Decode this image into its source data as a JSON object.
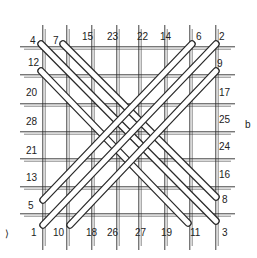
{
  "figure": {
    "panel_label": "b",
    "stray_mark": "⟩",
    "colors": {
      "ink": "#2a2a2a",
      "rod_fill": "#ffffff",
      "background": "#ffffff"
    }
  },
  "grid": {
    "columns_x": [
      44,
      68,
      93,
      118,
      140,
      166,
      191,
      217
    ],
    "rows_y": [
      48,
      76,
      105,
      133,
      160,
      188,
      215
    ],
    "left": 20,
    "right": 235,
    "top": 25,
    "bottom": 250
  },
  "labels": {
    "top": [
      {
        "text": "4",
        "x": 30,
        "y": 44
      },
      {
        "text": "7",
        "x": 53,
        "y": 44
      },
      {
        "text": "15",
        "x": 82,
        "y": 40
      },
      {
        "text": "23",
        "x": 107,
        "y": 40
      },
      {
        "text": "22",
        "x": 137,
        "y": 40
      },
      {
        "text": "14",
        "x": 160,
        "y": 40
      },
      {
        "text": "6",
        "x": 196,
        "y": 40
      },
      {
        "text": "2",
        "x": 219,
        "y": 40
      }
    ],
    "left": [
      {
        "text": "12",
        "x": 28,
        "y": 66
      },
      {
        "text": "20",
        "x": 26,
        "y": 96
      },
      {
        "text": "28",
        "x": 26,
        "y": 125
      },
      {
        "text": "21",
        "x": 26,
        "y": 154
      },
      {
        "text": "13",
        "x": 26,
        "y": 181
      },
      {
        "text": "5",
        "x": 28,
        "y": 209
      }
    ],
    "right": [
      {
        "text": "9",
        "x": 217,
        "y": 67
      },
      {
        "text": "17",
        "x": 219,
        "y": 96
      },
      {
        "text": "25",
        "x": 219,
        "y": 123
      },
      {
        "text": "24",
        "x": 219,
        "y": 150
      },
      {
        "text": "16",
        "x": 219,
        "y": 178
      },
      {
        "text": "8",
        "x": 222,
        "y": 203
      }
    ],
    "bottom": [
      {
        "text": "1",
        "x": 31,
        "y": 236
      },
      {
        "text": "10",
        "x": 53,
        "y": 236
      },
      {
        "text": "18",
        "x": 86,
        "y": 236
      },
      {
        "text": "26",
        "x": 107,
        "y": 236
      },
      {
        "text": "27",
        "x": 135,
        "y": 236
      },
      {
        "text": "19",
        "x": 161,
        "y": 236
      },
      {
        "text": "11",
        "x": 190,
        "y": 236
      },
      {
        "text": "3",
        "x": 222,
        "y": 236
      }
    ],
    "panel": {
      "text": "b",
      "x": 245,
      "y": 128
    }
  },
  "rods": [
    {
      "from": "4",
      "to": "3",
      "x1": 41,
      "y1": 44,
      "x2": 216,
      "y2": 221
    },
    {
      "from": "7",
      "to": "8",
      "x1": 63,
      "y1": 44,
      "x2": 216,
      "y2": 197
    },
    {
      "from": "12",
      "to": "11",
      "x1": 41,
      "y1": 71,
      "x2": 188,
      "y2": 223
    },
    {
      "from": "1",
      "to": "2",
      "x1": 43,
      "y1": 225,
      "x2": 216,
      "y2": 44
    },
    {
      "from": "5",
      "to": "6",
      "x1": 43,
      "y1": 200,
      "x2": 192,
      "y2": 44
    },
    {
      "from": "10",
      "to": "9",
      "x1": 70,
      "y1": 225,
      "x2": 216,
      "y2": 71
    }
  ]
}
